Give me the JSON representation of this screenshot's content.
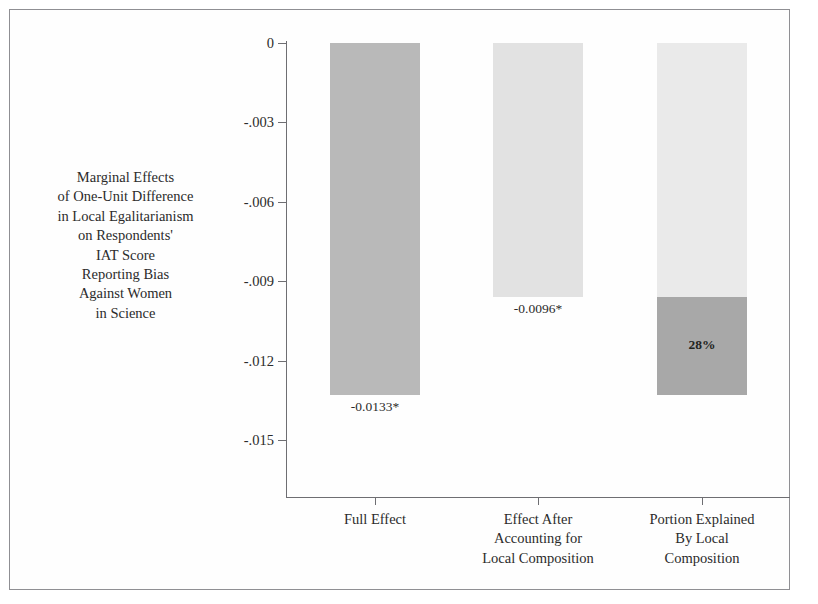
{
  "chart_data": {
    "type": "bar",
    "title": "",
    "subtitle": "",
    "xlabel": "",
    "ylabel_lines": [
      "Marginal Effects",
      "of One-Unit Difference",
      "in Local Egalitarianism",
      "on Respondents'",
      "IAT Score",
      "Reporting Bias",
      "Against Women",
      "in Science"
    ],
    "categories": [
      "Full Effect",
      "Effect After Accounting for Local Composition",
      "Portion Explained By Local Composition"
    ],
    "category_label_lines": [
      [
        "Full Effect"
      ],
      [
        "Effect After",
        "Accounting for",
        "Local Composition"
      ],
      [
        "Portion Explained",
        "By Local",
        "Composition"
      ]
    ],
    "values": [
      -0.0133,
      -0.0096,
      -0.0133
    ],
    "data_labels": [
      "-0.0133*",
      "-0.0096*",
      ""
    ],
    "inner_labels": [
      "",
      "",
      "28%"
    ],
    "bar_segments": [
      [
        {
          "from": 0,
          "to": -0.0133,
          "shade": "#b9b9b9",
          "label": ""
        }
      ],
      [
        {
          "from": 0,
          "to": -0.0096,
          "shade": "#e2e2e2",
          "label": ""
        }
      ],
      [
        {
          "from": 0,
          "to": -0.0096,
          "shade": "#eaeaea",
          "label": ""
        },
        {
          "from": -0.0096,
          "to": -0.0133,
          "shade": "#a8a8a8",
          "label": "28%"
        }
      ]
    ],
    "ylim": [
      -0.015,
      0
    ],
    "yticks": [
      0,
      -0.003,
      -0.006,
      -0.009,
      -0.012,
      -0.015
    ],
    "ytick_labels": [
      "0",
      "-.003",
      "-.006",
      "-.009",
      "-.012",
      "-.015"
    ],
    "grid": false,
    "legend": "none",
    "axis_color": "#6e6e72",
    "text_color": "#2b2b2b",
    "significance_note": "* denotes statistical significance"
  },
  "geometry": {
    "plot_left": 286,
    "plot_right": 790,
    "zero_y": 43,
    "bottom_y": 497,
    "px_per_unit": 26467,
    "bar_width": 90,
    "bar_centers": [
      375,
      538,
      702
    ]
  }
}
